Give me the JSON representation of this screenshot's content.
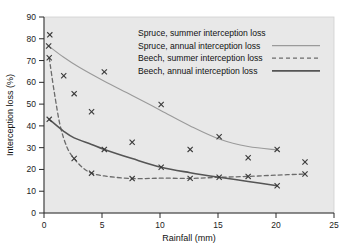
{
  "chart_data": {
    "type": "scatter",
    "title": "",
    "xlabel": "Rainfall (mm)",
    "ylabel": "Interception loss (%)",
    "xlim": [
      0,
      25
    ],
    "ylim": [
      0,
      90
    ],
    "xticks": [
      0,
      5,
      10,
      15,
      20,
      25
    ],
    "yticks": [
      0,
      10,
      20,
      30,
      40,
      50,
      60,
      70,
      80,
      90
    ],
    "grid": false,
    "legend_position": "top-right",
    "plot_background": "#e8e8e8",
    "series": [
      {
        "name": "Spruce, summer interception loss",
        "style": "markers",
        "marker": "x",
        "color": "#3a3a3a",
        "points": [
          [
            0.5,
            81.8
          ],
          [
            1.7,
            63.0
          ],
          [
            2.6,
            54.8
          ],
          [
            4.1,
            46.5
          ],
          [
            5.2,
            64.8
          ],
          [
            7.6,
            32.5
          ],
          [
            10.1,
            49.8
          ],
          [
            12.6,
            29.2
          ],
          [
            15.1,
            35.0
          ],
          [
            17.6,
            25.4
          ],
          [
            20.1,
            29.2
          ],
          [
            22.5,
            23.4
          ]
        ]
      },
      {
        "name": "Spruce, annual interception loss",
        "style": "line",
        "dash": "solid",
        "color": "#9a9a9a",
        "width": 1.1,
        "points": [
          [
            0.4,
            76.7
          ],
          [
            1.7,
            71.5
          ],
          [
            3.0,
            67.0
          ],
          [
            5.2,
            60.5
          ],
          [
            7.6,
            54.0
          ],
          [
            10.1,
            47.0
          ],
          [
            12.6,
            40.0
          ],
          [
            15.1,
            34.0
          ],
          [
            17.6,
            30.5
          ],
          [
            20.1,
            29.0
          ]
        ]
      },
      {
        "name": "Beech, summer interception loss",
        "style": "line",
        "dash": "dashed",
        "color": "#6b6b6b",
        "width": 1.3,
        "points": [
          [
            0.45,
            71.3
          ],
          [
            0.9,
            55.0
          ],
          [
            1.4,
            40.0
          ],
          [
            2.0,
            30.0
          ],
          [
            2.6,
            25.0
          ],
          [
            3.3,
            21.0
          ],
          [
            4.1,
            18.3
          ],
          [
            5.2,
            17.0
          ],
          [
            7.6,
            15.8
          ],
          [
            10.1,
            16.0
          ],
          [
            12.6,
            15.9
          ],
          [
            15.1,
            16.4
          ],
          [
            17.6,
            16.8
          ],
          [
            20.1,
            17.4
          ],
          [
            22.5,
            17.9
          ]
        ]
      },
      {
        "name": "Beech, annual interception loss",
        "style": "line",
        "dash": "solid",
        "color": "#555555",
        "width": 1.6,
        "points": [
          [
            0.45,
            43.0
          ],
          [
            1.7,
            37.5
          ],
          [
            2.6,
            34.5
          ],
          [
            4.1,
            31.5
          ],
          [
            5.2,
            29.2
          ],
          [
            7.6,
            25.0
          ],
          [
            10.1,
            21.0
          ],
          [
            12.6,
            18.5
          ],
          [
            15.1,
            16.4
          ],
          [
            17.6,
            14.5
          ],
          [
            20.1,
            12.5
          ]
        ]
      }
    ],
    "markers": {
      "glyph": "x",
      "color": "#3a3a3a",
      "all_points": [
        [
          0.5,
          81.8
        ],
        [
          0.4,
          76.7
        ],
        [
          0.45,
          71.3
        ],
        [
          0.45,
          43.0
        ],
        [
          1.7,
          63.0
        ],
        [
          2.6,
          54.8
        ],
        [
          2.6,
          25.0
        ],
        [
          4.1,
          46.5
        ],
        [
          4.1,
          18.3
        ],
        [
          5.2,
          64.8
        ],
        [
          5.2,
          29.2
        ],
        [
          7.6,
          32.5
        ],
        [
          7.6,
          15.8
        ],
        [
          10.1,
          49.8
        ],
        [
          10.1,
          21.0
        ],
        [
          12.6,
          29.2
        ],
        [
          12.6,
          15.9
        ],
        [
          15.1,
          35.0
        ],
        [
          15.1,
          16.4
        ],
        [
          17.6,
          25.4
        ],
        [
          17.6,
          16.8
        ],
        [
          20.1,
          29.2
        ],
        [
          20.1,
          12.5
        ],
        [
          22.5,
          23.4
        ],
        [
          22.5,
          17.9
        ]
      ]
    }
  },
  "axes": {
    "x_title": "Rainfall (mm)",
    "y_title": "Interception loss (%)",
    "x_ticks": [
      "0",
      "5",
      "10",
      "15",
      "20",
      "25"
    ],
    "y_ticks": [
      "0",
      "10",
      "20",
      "30",
      "40",
      "50",
      "60",
      "70",
      "80",
      "90"
    ]
  },
  "legend": {
    "entries": [
      {
        "label": "Spruce, summer interception loss",
        "sample": "none"
      },
      {
        "label": "Spruce, annual interception loss",
        "sample": "solid-light"
      },
      {
        "label": "Beech, summer interception loss",
        "sample": "dashed"
      },
      {
        "label": "Beech, annual interception loss",
        "sample": "solid-dark"
      }
    ]
  }
}
